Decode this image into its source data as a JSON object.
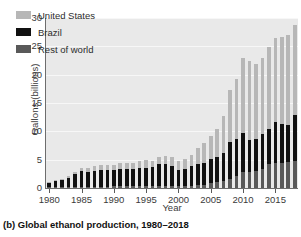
{
  "caption": "(b) Global ethanol production, 1980–2018",
  "chart_data": {
    "type": "bar",
    "stacked": true,
    "title": "",
    "subtitle": "",
    "xlabel": "Year",
    "ylabel": "Gallons (billions)",
    "ylim": [
      0,
      30
    ],
    "yticks": [
      0,
      5,
      10,
      15,
      20,
      25,
      30
    ],
    "xticks": [
      1980,
      1985,
      1990,
      1995,
      2000,
      2005,
      2010,
      2015
    ],
    "xlim": [
      1979.4,
      2018.6
    ],
    "grid": true,
    "legend_position": "top-left",
    "categories": [
      1980,
      1981,
      1982,
      1983,
      1984,
      1985,
      1986,
      1987,
      1988,
      1989,
      1990,
      1991,
      1992,
      1993,
      1994,
      1995,
      1996,
      1997,
      1998,
      1999,
      2000,
      2001,
      2002,
      2003,
      2004,
      2005,
      2006,
      2007,
      2008,
      2009,
      2010,
      2011,
      2012,
      2013,
      2014,
      2015,
      2016,
      2017,
      2018
    ],
    "series": [
      {
        "name": "Rest of world",
        "color": "#595959",
        "values": [
          0.1,
          0.1,
          0.1,
          0.1,
          0.2,
          0.2,
          0.2,
          0.2,
          0.2,
          0.2,
          0.3,
          0.3,
          0.3,
          0.3,
          0.3,
          0.3,
          0.3,
          0.3,
          0.3,
          0.3,
          0.3,
          0.3,
          0.4,
          0.5,
          0.6,
          0.8,
          1.0,
          1.2,
          1.6,
          2.1,
          2.8,
          2.9,
          3.0,
          3.3,
          4.3,
          4.5,
          4.5,
          4.6,
          4.7
        ]
      },
      {
        "name": "Brazil",
        "color": "#111111",
        "values": [
          0.8,
          1.1,
          1.3,
          1.7,
          2.2,
          2.8,
          2.7,
          2.8,
          3.0,
          3.0,
          2.9,
          3.1,
          3.1,
          3.0,
          3.2,
          3.2,
          3.4,
          3.9,
          3.9,
          3.6,
          2.8,
          3.0,
          3.4,
          3.7,
          3.9,
          4.4,
          4.5,
          5.0,
          6.5,
          6.6,
          6.9,
          5.6,
          5.6,
          6.3,
          6.2,
          7.1,
          6.8,
          6.6,
          8.1
        ]
      },
      {
        "name": "United States",
        "color": "#b7b7b7",
        "values": [
          0.2,
          0.2,
          0.2,
          0.4,
          0.4,
          0.6,
          0.7,
          0.8,
          0.8,
          0.9,
          0.9,
          1.0,
          1.1,
          1.2,
          1.3,
          1.4,
          1.0,
          1.3,
          1.4,
          1.5,
          1.6,
          1.8,
          2.1,
          2.8,
          3.4,
          3.9,
          4.9,
          6.5,
          9.2,
          10.6,
          13.2,
          13.9,
          13.2,
          13.4,
          14.3,
          14.8,
          15.4,
          15.8,
          16.0
        ]
      }
    ]
  },
  "legend": [
    {
      "label": "United States",
      "color": "#b7b7b7",
      "swatch": "legend-swatch-united-states"
    },
    {
      "label": "Brazil",
      "color": "#111111",
      "swatch": "legend-swatch-brazil"
    },
    {
      "label": "Rest of world",
      "color": "#595959",
      "swatch": "legend-swatch-rest-of-world"
    }
  ]
}
